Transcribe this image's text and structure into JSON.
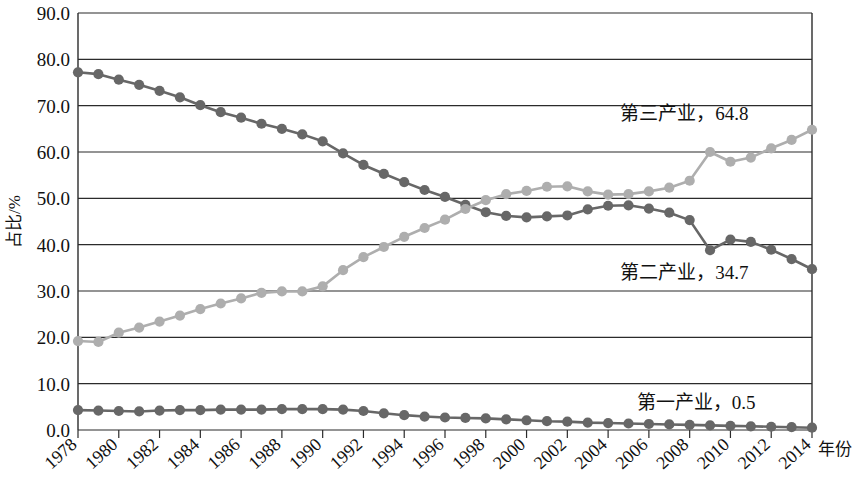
{
  "chart_data": {
    "type": "line",
    "title": "",
    "xlabel": "年份",
    "ylabel": "占比/%",
    "ylim": [
      0,
      90
    ],
    "xlim": [
      1978,
      2014
    ],
    "grid": true,
    "legend_position": "inline-annotation",
    "x": [
      1978,
      1979,
      1980,
      1981,
      1982,
      1983,
      1984,
      1985,
      1986,
      1987,
      1988,
      1989,
      1990,
      1991,
      1992,
      1993,
      1994,
      1995,
      1996,
      1997,
      1998,
      1999,
      2000,
      2001,
      2002,
      2003,
      2004,
      2005,
      2006,
      2007,
      2008,
      2009,
      2010,
      2011,
      2012,
      2013,
      2014
    ],
    "x_tick_labels": [
      "1978",
      "1980",
      "1982",
      "1984",
      "1986",
      "1988",
      "1990",
      "1992",
      "1994",
      "1996",
      "1998",
      "2000",
      "2002",
      "2004",
      "2006",
      "2008",
      "2010",
      "2012",
      "2014"
    ],
    "y_tick_labels": [
      "0.0",
      "10.0",
      "20.0",
      "30.0",
      "40.0",
      "50.0",
      "60.0",
      "70.0",
      "80.0",
      "90.0"
    ],
    "y_ticks": [
      0,
      10,
      20,
      30,
      40,
      50,
      60,
      70,
      80,
      90
    ],
    "series": [
      {
        "name": "第二产业",
        "label": "第二产业，34.7",
        "end_value": 34.7,
        "color": "#676767",
        "marker": "circle",
        "values": [
          77.2,
          76.8,
          75.6,
          74.5,
          73.2,
          71.8,
          70.1,
          68.6,
          67.4,
          66.1,
          65.0,
          63.8,
          62.3,
          59.7,
          57.2,
          55.3,
          53.5,
          51.8,
          50.3,
          48.6,
          47.0,
          46.2,
          45.9,
          46.1,
          46.3,
          47.6,
          48.4,
          48.5,
          47.8,
          46.9,
          45.3,
          38.8,
          41.1,
          40.6,
          38.9,
          36.9,
          34.7
        ]
      },
      {
        "name": "第三产业",
        "label": "第三产业，64.8",
        "end_value": 64.8,
        "color": "#aeaeae",
        "marker": "circle",
        "values": [
          19.2,
          19.0,
          21.0,
          22.1,
          23.4,
          24.7,
          26.1,
          27.3,
          28.4,
          29.6,
          29.9,
          29.9,
          31.0,
          34.5,
          37.3,
          39.5,
          41.7,
          43.6,
          45.4,
          47.7,
          49.6,
          50.9,
          51.6,
          52.5,
          52.6,
          51.5,
          50.8,
          50.9,
          51.5,
          52.3,
          53.8,
          60.0,
          57.9,
          58.8,
          60.8,
          62.6,
          64.8
        ]
      },
      {
        "name": "第一产业",
        "label": "第一产业，0.5",
        "end_value": 0.5,
        "color": "#676767",
        "marker": "circle",
        "values": [
          4.3,
          4.2,
          4.1,
          4.0,
          4.2,
          4.3,
          4.3,
          4.4,
          4.4,
          4.4,
          4.5,
          4.5,
          4.5,
          4.4,
          4.1,
          3.6,
          3.2,
          2.9,
          2.7,
          2.6,
          2.5,
          2.3,
          2.1,
          1.9,
          1.8,
          1.6,
          1.5,
          1.4,
          1.3,
          1.2,
          1.1,
          1.0,
          0.9,
          0.8,
          0.7,
          0.6,
          0.5
        ]
      }
    ],
    "annotations": [
      {
        "text": "第三产业，64.8",
        "x": 2004.6,
        "y": 67.0
      },
      {
        "text": "第二产业，34.7",
        "x": 2004.6,
        "y": 32.5
      },
      {
        "text": "第一产业，0.5",
        "x": 2005.4,
        "y": 4.5
      }
    ]
  },
  "colors": {
    "secondary_series": "#676767",
    "tertiary_series": "#aeaeae",
    "primary_series": "#676767",
    "grid": "#2b2b2b",
    "text": "#111111",
    "background": "#ffffff"
  }
}
